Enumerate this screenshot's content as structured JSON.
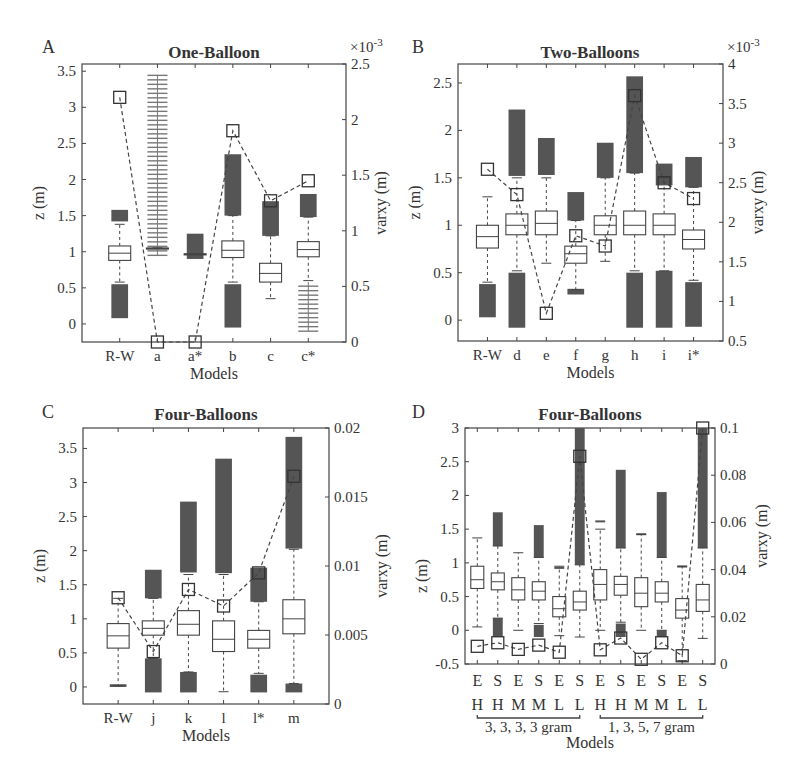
{
  "chart_data": [
    {
      "panel": "A",
      "type": "box",
      "title": "One-Balloon",
      "xlabel": "Models",
      "ylabel": "z (m)",
      "ylabel_right": "varxy (m)",
      "right_axis_multiplier": "×10^-3",
      "ylim": [
        -0.25,
        3.6
      ],
      "ylim_right": [
        0,
        2.5
      ],
      "yticks": [
        0,
        0.5,
        1,
        1.5,
        2,
        2.5,
        3,
        3.5
      ],
      "yticks_right": [
        0,
        0.5,
        1,
        1.5,
        2,
        2.5
      ],
      "categories": [
        "R-W",
        "a",
        "a*",
        "b",
        "c",
        "c*"
      ],
      "boxes": [
        {
          "cat": "R-W",
          "q1": 0.88,
          "median": 0.98,
          "q3": 1.08,
          "wlo": 0.58,
          "whi": 1.38
        },
        {
          "cat": "a",
          "q1": 1.05,
          "median": 1.05,
          "q3": 1.05,
          "wlo": 1.05,
          "whi": 1.05
        },
        {
          "cat": "a*",
          "q1": 0.97,
          "median": 0.97,
          "q3": 0.97,
          "wlo": 0.97,
          "whi": 0.97
        },
        {
          "cat": "b",
          "q1": 0.92,
          "median": 1.02,
          "q3": 1.15,
          "wlo": 0.58,
          "whi": 1.5
        },
        {
          "cat": "c",
          "q1": 0.58,
          "median": 0.7,
          "q3": 0.84,
          "wlo": 0.35,
          "whi": 1.22
        },
        {
          "cat": "c*",
          "q1": 0.93,
          "median": 1.03,
          "q3": 1.14,
          "wlo": 0.6,
          "whi": 1.48
        }
      ],
      "outlier_ranges": [
        {
          "cat": "R-W",
          "ranges": [
            [
              0.08,
              0.55
            ],
            [
              1.42,
              1.58
            ]
          ]
        },
        {
          "cat": "a",
          "ranges": [
            [
              0.95,
              3.45
            ]
          ],
          "sparse": true
        },
        {
          "cat": "a*",
          "ranges": [
            [
              0.9,
              1.25
            ]
          ]
        },
        {
          "cat": "b",
          "ranges": [
            [
              -0.05,
              0.55
            ],
            [
              1.5,
              2.35
            ]
          ]
        },
        {
          "cat": "c",
          "ranges": [
            [
              1.22,
              1.7
            ]
          ]
        },
        {
          "cat": "c*",
          "ranges": [
            [
              -0.1,
              0.58
            ]
          ],
          "sparse": true
        },
        {
          "cat": "c*",
          "ranges": [
            [
              1.48,
              1.8
            ]
          ]
        }
      ],
      "varxy_series": {
        "name": "varxy",
        "values": [
          2.2,
          0.0,
          0.0,
          1.9,
          1.27,
          1.45
        ]
      }
    },
    {
      "panel": "B",
      "type": "box",
      "title": "Two-Balloons",
      "xlabel": "Models",
      "ylabel": "z (m)",
      "ylabel_right": "varxy (m)",
      "right_axis_multiplier": "×10^-3",
      "ylim": [
        -0.22,
        2.7
      ],
      "ylim_right": [
        0.5,
        4
      ],
      "yticks": [
        0,
        0.5,
        1,
        1.5,
        2,
        2.5
      ],
      "yticks_right": [
        0.5,
        1,
        1.5,
        2,
        2.5,
        3,
        3.5,
        4
      ],
      "categories": [
        "R-W",
        "d",
        "e",
        "f",
        "g",
        "h",
        "i",
        "i*"
      ],
      "boxes": [
        {
          "cat": "R-W",
          "q1": 0.76,
          "median": 0.88,
          "q3": 1.0,
          "wlo": 0.4,
          "whi": 1.3
        },
        {
          "cat": "d",
          "q1": 0.9,
          "median": 1.0,
          "q3": 1.12,
          "wlo": 0.52,
          "whi": 1.5
        },
        {
          "cat": "e",
          "q1": 0.9,
          "median": 1.02,
          "q3": 1.15,
          "wlo": 0.6,
          "whi": 1.5
        },
        {
          "cat": "f",
          "q1": 0.6,
          "median": 0.7,
          "q3": 0.78,
          "wlo": 0.32,
          "whi": 1.05
        },
        {
          "cat": "g",
          "q1": 0.9,
          "median": 1.0,
          "q3": 1.1,
          "wlo": 0.62,
          "whi": 1.5
        },
        {
          "cat": "h",
          "q1": 0.9,
          "median": 1.0,
          "q3": 1.15,
          "wlo": 0.52,
          "whi": 1.55
        },
        {
          "cat": "i",
          "q1": 0.9,
          "median": 1.0,
          "q3": 1.12,
          "wlo": 0.52,
          "whi": 1.5
        },
        {
          "cat": "i*",
          "q1": 0.75,
          "median": 0.85,
          "q3": 0.95,
          "wlo": 0.42,
          "whi": 1.4
        }
      ],
      "outlier_ranges": [
        {
          "cat": "R-W",
          "ranges": [
            [
              0.03,
              0.38
            ]
          ]
        },
        {
          "cat": "d",
          "ranges": [
            [
              -0.08,
              0.5
            ],
            [
              1.52,
              2.22
            ]
          ]
        },
        {
          "cat": "e",
          "ranges": [
            [
              1.53,
              1.92
            ]
          ]
        },
        {
          "cat": "f",
          "ranges": [
            [
              0.27,
              0.33
            ],
            [
              1.05,
              1.35
            ]
          ]
        },
        {
          "cat": "g",
          "ranges": [
            [
              1.5,
              1.87
            ]
          ]
        },
        {
          "cat": "h",
          "ranges": [
            [
              -0.08,
              0.5
            ],
            [
              1.55,
              2.57
            ]
          ]
        },
        {
          "cat": "i",
          "ranges": [
            [
              -0.08,
              0.52
            ],
            [
              1.42,
              1.65
            ]
          ]
        },
        {
          "cat": "i*",
          "ranges": [
            [
              -0.07,
              0.4
            ],
            [
              1.4,
              1.72
            ]
          ]
        }
      ],
      "varxy_series": {
        "name": "varxy",
        "values": [
          2.67,
          2.35,
          0.85,
          1.83,
          1.7,
          3.6,
          2.5,
          2.3
        ]
      }
    },
    {
      "panel": "C",
      "type": "box",
      "title": "Four-Balloons",
      "xlabel": "Models",
      "ylabel": "z (m)",
      "ylabel_right": "varxy (m)",
      "ylim": [
        -0.25,
        3.8
      ],
      "ylim_right": [
        0,
        0.02
      ],
      "yticks": [
        0,
        0.5,
        1,
        1.5,
        2,
        2.5,
        3,
        3.5
      ],
      "yticks_right": [
        0,
        0.005,
        0.01,
        0.015,
        0.02
      ],
      "categories": [
        "R-W",
        "j",
        "k",
        "l",
        "l*",
        "m"
      ],
      "boxes": [
        {
          "cat": "R-W",
          "q1": 0.57,
          "median": 0.75,
          "q3": 0.93,
          "wlo": 0.02,
          "whi": 1.3
        },
        {
          "cat": "j",
          "q1": 0.76,
          "median": 0.86,
          "q3": 0.97,
          "wlo": 0.42,
          "whi": 1.3
        },
        {
          "cat": "k",
          "q1": 0.76,
          "median": 0.92,
          "q3": 1.12,
          "wlo": 0.22,
          "whi": 1.65
        },
        {
          "cat": "l",
          "q1": 0.52,
          "median": 0.7,
          "q3": 0.97,
          "wlo": -0.07,
          "whi": 1.65
        },
        {
          "cat": "l*",
          "q1": 0.57,
          "median": 0.7,
          "q3": 0.83,
          "wlo": 0.2,
          "whi": 1.25
        },
        {
          "cat": "m",
          "q1": 0.78,
          "median": 1.0,
          "q3": 1.28,
          "wlo": 0.05,
          "whi": 2.02
        }
      ],
      "outlier_ranges": [
        {
          "cat": "R-W",
          "ranges": [
            [
              0.0,
              0.04
            ]
          ]
        },
        {
          "cat": "j",
          "ranges": [
            [
              -0.08,
              0.42
            ],
            [
              1.3,
              1.72
            ]
          ]
        },
        {
          "cat": "k",
          "ranges": [
            [
              -0.08,
              0.22
            ],
            [
              1.68,
              2.72
            ]
          ]
        },
        {
          "cat": "l",
          "ranges": [
            [
              1.67,
              3.35
            ]
          ]
        },
        {
          "cat": "l*",
          "ranges": [
            [
              -0.08,
              0.18
            ],
            [
              1.25,
              1.75
            ]
          ]
        },
        {
          "cat": "m",
          "ranges": [
            [
              -0.08,
              0.05
            ],
            [
              2.03,
              3.67
            ]
          ]
        }
      ],
      "varxy_series": {
        "name": "varxy",
        "values": [
          0.0077,
          0.0038,
          0.0083,
          0.0071,
          0.0095,
          0.0165
        ]
      }
    },
    {
      "panel": "D",
      "type": "box",
      "title": "Four-Balloons",
      "xlabel": "Models",
      "ylabel": "z (m)",
      "ylabel_right": "varxy (m)",
      "ylim": [
        -0.5,
        3
      ],
      "ylim_right": [
        0,
        0.1
      ],
      "yticks": [
        -0.5,
        0,
        0.5,
        1,
        1.5,
        2,
        2.5,
        3
      ],
      "yticks_right": [
        0,
        0.02,
        0.04,
        0.06,
        0.08,
        0.1
      ],
      "categories": [
        "E H",
        "S H",
        "E M",
        "S M",
        "E L",
        "S L",
        "E H",
        "S H",
        "E M",
        "S M",
        "E L",
        "S L"
      ],
      "tick_row1": [
        "E",
        "S",
        "E",
        "S",
        "E",
        "S",
        "E",
        "S",
        "E",
        "S",
        "E",
        "S"
      ],
      "tick_row2": [
        "H",
        "H",
        "M",
        "M",
        "L",
        "L",
        "H",
        "H",
        "M",
        "M",
        "L",
        "L"
      ],
      "groups": [
        {
          "label": "3, 3, 3, 3 gram",
          "span": [
            0,
            5
          ]
        },
        {
          "label": "1, 3, 5, 7 gram",
          "span": [
            6,
            11
          ]
        }
      ],
      "boxes": [
        {
          "q1": 0.62,
          "median": 0.75,
          "q3": 0.95,
          "wlo": 0.05,
          "whi": 1.37
        },
        {
          "q1": 0.6,
          "median": 0.72,
          "q3": 0.85,
          "wlo": 0.18,
          "whi": 1.25
        },
        {
          "q1": 0.45,
          "median": 0.6,
          "q3": 0.78,
          "wlo": 0.0,
          "whi": 1.15
        },
        {
          "q1": 0.45,
          "median": 0.58,
          "q3": 0.72,
          "wlo": 0.1,
          "whi": 1.08
        },
        {
          "q1": 0.2,
          "median": 0.32,
          "q3": 0.5,
          "wlo": -0.08,
          "whi": 0.95
        },
        {
          "q1": 0.3,
          "median": 0.42,
          "q3": 0.58,
          "wlo": -0.1,
          "whi": 0.97
        },
        {
          "q1": 0.45,
          "median": 0.68,
          "q3": 0.9,
          "wlo": 0.0,
          "whi": 1.5
        },
        {
          "q1": 0.52,
          "median": 0.68,
          "q3": 0.8,
          "wlo": 0.12,
          "whi": 1.22
        },
        {
          "q1": 0.35,
          "median": 0.55,
          "q3": 0.78,
          "wlo": 0.0,
          "whi": 1.42
        },
        {
          "q1": 0.42,
          "median": 0.55,
          "q3": 0.72,
          "wlo": 0.0,
          "whi": 1.08
        },
        {
          "q1": 0.18,
          "median": 0.3,
          "q3": 0.47,
          "wlo": -0.45,
          "whi": 0.95
        },
        {
          "q1": 0.28,
          "median": 0.45,
          "q3": 0.68,
          "wlo": -0.12,
          "whi": 1.22
        }
      ],
      "outlier_ranges": [
        {
          "idx": 1,
          "ranges": [
            [
              -0.1,
              0.18
            ],
            [
              1.25,
              1.75
            ]
          ]
        },
        {
          "idx": 3,
          "ranges": [
            [
              -0.1,
              0.08
            ],
            [
              1.08,
              1.56
            ]
          ]
        },
        {
          "idx": 4,
          "ranges": [
            [
              0.92,
              0.94
            ]
          ]
        },
        {
          "idx": 5,
          "ranges": [
            [
              0.97,
              3.0
            ]
          ]
        },
        {
          "idx": 6,
          "ranges": [
            [
              1.61,
              1.63
            ]
          ]
        },
        {
          "idx": 7,
          "ranges": [
            [
              -0.1,
              0.1
            ],
            [
              1.22,
              2.38
            ]
          ]
        },
        {
          "idx": 8,
          "ranges": [
            [
              1.42,
              1.44
            ]
          ]
        },
        {
          "idx": 9,
          "ranges": [
            [
              -0.1,
              0.0
            ],
            [
              1.08,
              2.05
            ]
          ]
        },
        {
          "idx": 10,
          "ranges": [
            [
              0.94,
              0.96
            ]
          ]
        },
        {
          "idx": 11,
          "ranges": [
            [
              1.22,
              3.0
            ]
          ]
        }
      ],
      "varxy_series": {
        "name": "varxy",
        "values": [
          0.0075,
          0.009,
          0.0062,
          0.008,
          0.005,
          0.088,
          0.006,
          0.011,
          0.002,
          0.009,
          0.0035,
          0.1
        ]
      }
    }
  ],
  "panels": {
    "A": {
      "letter": "A",
      "title": "One-Balloon",
      "mult": "×10",
      "mult_exp": "-3"
    },
    "B": {
      "letter": "B",
      "title": "Two-Balloons",
      "mult": "×10",
      "mult_exp": "-3"
    },
    "C": {
      "letter": "C",
      "title": "Four-Balloons"
    },
    "D": {
      "letter": "D",
      "title": "Four-Balloons"
    }
  },
  "labels": {
    "xlabel": "Models",
    "ylabel": "z (m)",
    "ylabel_right": "varxy (m)"
  }
}
